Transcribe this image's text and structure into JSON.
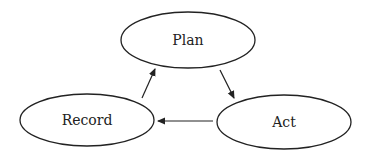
{
  "diagram": {
    "type": "cycle",
    "nodes": [
      {
        "id": "plan",
        "label": "Plan"
      },
      {
        "id": "act",
        "label": "Act"
      },
      {
        "id": "record",
        "label": "Record"
      }
    ],
    "edges": [
      {
        "from": "plan",
        "to": "act"
      },
      {
        "from": "act",
        "to": "record"
      },
      {
        "from": "record",
        "to": "plan"
      }
    ],
    "colors": {
      "stroke": "#222222",
      "fill": "#ffffff",
      "background": "#ffffff"
    }
  }
}
